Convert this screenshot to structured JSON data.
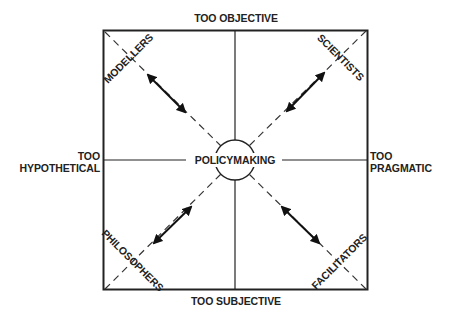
{
  "diagram": {
    "center_label": "POLICYMAKING",
    "axes": {
      "top": "TOO OBJECTIVE",
      "bottom": "TOO SUBJECTIVE",
      "left": [
        "TOO",
        "HYPOTHETICAL"
      ],
      "right": [
        "TOO",
        "PRAGMATIC"
      ]
    },
    "quadrants": {
      "top_left": "MODELLERS",
      "top_right": "SCIENTISTS",
      "bottom_left": "PHILOSOPHERS",
      "bottom_right": "FACILITATORS"
    },
    "relations": [
      {
        "from": "MODELLERS",
        "to": "POLICYMAKING",
        "type": "bidirectional"
      },
      {
        "from": "SCIENTISTS",
        "to": "POLICYMAKING",
        "type": "bidirectional"
      },
      {
        "from": "PHILOSOPHERS",
        "to": "POLICYMAKING",
        "type": "bidirectional"
      },
      {
        "from": "FACILITATORS",
        "to": "POLICYMAKING",
        "type": "bidirectional"
      }
    ],
    "colors": {
      "ink": "#222222",
      "background": "#ffffff"
    }
  }
}
